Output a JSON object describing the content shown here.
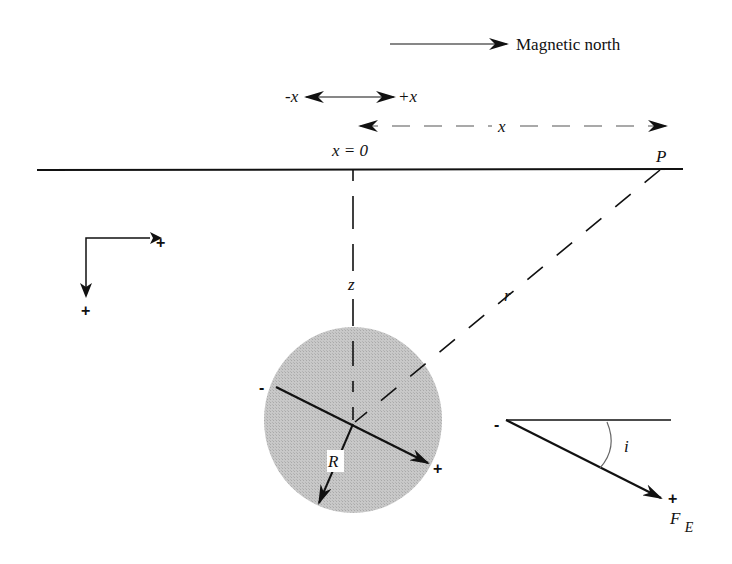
{
  "figure": {
    "legend": {
      "north_arrow_label": "Magnetic north"
    },
    "x_direction": {
      "minus_label": "-x",
      "plus_label": "+x"
    },
    "distance": {
      "x_label": "x",
      "origin_label": "x = 0",
      "observation_point_label": "P"
    },
    "axes_key": {
      "horizontal_plus": "+",
      "vertical_plus": "+"
    },
    "geometry": {
      "depth_label": "z",
      "range_label": "r",
      "radius_label": "R"
    },
    "sphere": {
      "dipole_minus": "-",
      "dipole_plus": "+",
      "fill_color": "#c4c4c4"
    },
    "field": {
      "inclination_label": "i",
      "vector_minus": "-",
      "vector_plus": "+",
      "vector_label": "F",
      "vector_subscript": "E"
    }
  }
}
